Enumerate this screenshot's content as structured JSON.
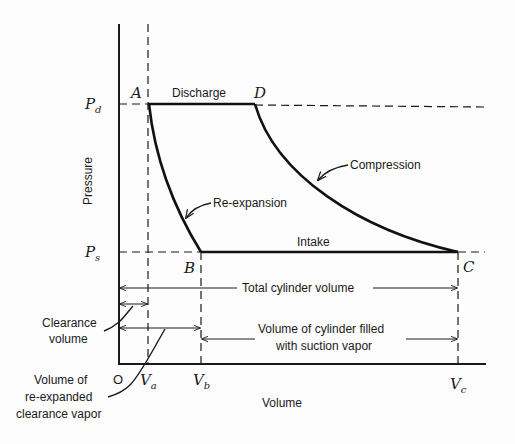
{
  "diagram": {
    "type": "pressure-volume diagram (reciprocating compressor cycle)",
    "axes": {
      "y_label": "Pressure",
      "x_label": "Volume",
      "origin_label": "O",
      "y_ticks": [
        {
          "symbol": "P",
          "sub": "d"
        },
        {
          "symbol": "P",
          "sub": "s"
        }
      ],
      "x_ticks": [
        {
          "symbol": "V",
          "sub": "a"
        },
        {
          "symbol": "V",
          "sub": "b"
        },
        {
          "symbol": "V",
          "sub": "c"
        }
      ]
    },
    "points": {
      "A": "A",
      "B": "B",
      "C": "C",
      "D": "D"
    },
    "processes": {
      "discharge": "Discharge",
      "compression": "Compression",
      "re_expansion": "Re-expansion",
      "intake": "Intake"
    },
    "dimensions": {
      "total": "Total cylinder volume",
      "clearance_1": "Clearance",
      "clearance_2": "volume",
      "suction_1": "Volume of cylinder filled",
      "suction_2": "with suction vapor",
      "reexp_1": "Volume of",
      "reexp_2": "re-expanded",
      "reexp_3": "clearance vapor"
    }
  }
}
